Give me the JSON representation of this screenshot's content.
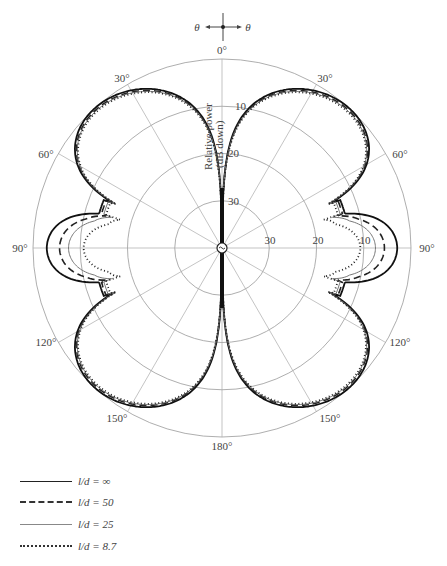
{
  "chart_data": {
    "type": "polar-line",
    "radial_axis_label": "Relative power (dB down)",
    "radial_ticks": [
      10,
      20,
      30
    ],
    "radial_range_db": [
      0,
      40
    ],
    "angle_ticks": [
      "0°",
      "30°",
      "60°",
      "90°",
      "120°",
      "150°",
      "180°",
      "150°",
      "120°",
      "90°",
      "60°",
      "30°"
    ],
    "angle_step_deg": 30,
    "orientation_marker": {
      "left": "θ",
      "right": "θ"
    },
    "series": [
      {
        "name": "l/d = ∞",
        "style": "solid-thick",
        "lobe_peak_deg": 42,
        "main_lobe_db": 0,
        "side_lobe_90_db": -2.3,
        "null_deg": 70.5
      },
      {
        "name": "l/d = 50",
        "style": "dashed",
        "lobe_peak_deg": 42,
        "main_lobe_db": -0.4,
        "side_lobe_90_db": -4.6,
        "null_deg": 71
      },
      {
        "name": "l/d = 25",
        "style": "solid-thin",
        "lobe_peak_deg": 42,
        "main_lobe_db": -0.6,
        "side_lobe_90_db": -6.3,
        "null_deg": 72
      },
      {
        "name": "l/d = 8.7",
        "style": "dotted",
        "lobe_peak_deg": 43,
        "main_lobe_db": -0.8,
        "side_lobe_90_db": -9.3,
        "null_deg": 76
      }
    ],
    "legend_position": "bottom-left"
  },
  "labels": {
    "radial_axis": "Relative power",
    "radial_axis_2": "(dB down)",
    "theta": "θ",
    "ticks": {
      "r10": "10",
      "r20": "20",
      "r30": "30"
    },
    "angles": {
      "a0": "0°",
      "a30r": "30°",
      "a60r": "60°",
      "a90r": "90°",
      "a120r": "120°",
      "a150r": "150°",
      "a180": "180°",
      "a150l": "150°",
      "a120l": "120°",
      "a90l": "90°",
      "a60l": "60°",
      "a30l": "30°"
    }
  },
  "legend": [
    {
      "label": "l/d = ∞"
    },
    {
      "label": "l/d = 50"
    },
    {
      "label": "l/d = 25"
    },
    {
      "label": "l/d = 8.7"
    }
  ]
}
